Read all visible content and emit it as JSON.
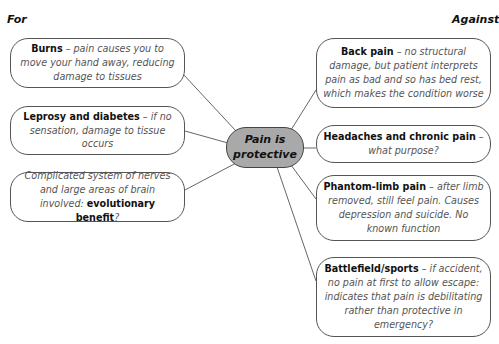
{
  "labels": {
    "for": "For",
    "against": "Against"
  },
  "center": {
    "line1": "Pain is",
    "line2": "protective",
    "fill": "#a9a9a9"
  },
  "for_items": [
    {
      "title": "Burns",
      "text": " – pain causes you to move your hand away, reducing damage to tissues"
    },
    {
      "title": "Leprosy and diabetes",
      "text": " – if no sensation, damage to tissue occurs"
    },
    {
      "pre": "Complicated system of nerves and large areas of brain involved: ",
      "title": "evolutionary benefit",
      "text": "?"
    }
  ],
  "against_items": [
    {
      "title": "Back pain",
      "text": " – no structural damage, but patient interprets pain as bad and so has bed rest, which makes the condition worse"
    },
    {
      "title": "Headaches and chronic pain",
      "text": " – what purpose?"
    },
    {
      "title": "Phantom-limb pain",
      "text": " – after limb removed, still feel pain. Causes depression and suicide. No known function"
    },
    {
      "title": "Battlefield/sports",
      "text": " – if accident, no pain at first to allow escape: indicates that pain is debilitating rather than protective in emergency?"
    }
  ]
}
